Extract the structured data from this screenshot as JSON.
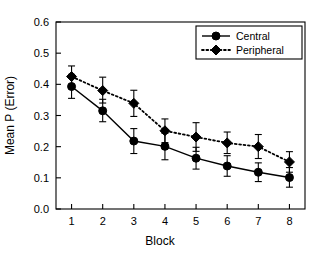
{
  "chart_data": {
    "type": "line",
    "title": "",
    "subtitle": "",
    "xlabel": "Block",
    "ylabel": "Mean P (Error)",
    "categories": [
      "1",
      "2",
      "3",
      "4",
      "5",
      "6",
      "7",
      "8"
    ],
    "x": [
      1,
      2,
      3,
      4,
      5,
      6,
      7,
      8
    ],
    "xlim": [
      0.5,
      8.5
    ],
    "ylim": [
      0.0,
      0.6
    ],
    "yticks": [
      "0.0",
      "0.1",
      "0.2",
      "0.3",
      "0.4",
      "0.5",
      "0.6"
    ],
    "ytick_values": [
      0.0,
      0.1,
      0.2,
      0.3,
      0.4,
      0.5,
      0.6
    ],
    "xticks": [
      "1",
      "2",
      "3",
      "4",
      "5",
      "6",
      "7",
      "8"
    ],
    "grid": false,
    "legend_position": "top-right",
    "series": [
      {
        "name": "Central",
        "marker": "circle",
        "linestyle": "solid",
        "color": "#000000",
        "values": [
          0.393,
          0.315,
          0.218,
          0.201,
          0.163,
          0.138,
          0.118,
          0.101
        ],
        "error_low": [
          0.355,
          0.28,
          0.178,
          0.158,
          0.128,
          0.105,
          0.088,
          0.07
        ],
        "error_high": [
          0.432,
          0.352,
          0.258,
          0.243,
          0.198,
          0.171,
          0.148,
          0.133
        ]
      },
      {
        "name": "Peripheral",
        "marker": "diamond",
        "linestyle": "dotted",
        "color": "#000000",
        "values": [
          0.425,
          0.38,
          0.339,
          0.251,
          0.231,
          0.212,
          0.2,
          0.151
        ],
        "error_low": [
          0.39,
          0.34,
          0.297,
          0.213,
          0.185,
          0.178,
          0.162,
          0.118
        ],
        "error_high": [
          0.459,
          0.423,
          0.381,
          0.289,
          0.277,
          0.247,
          0.239,
          0.184
        ]
      }
    ]
  },
  "legend": {
    "entries": [
      {
        "label": "Central"
      },
      {
        "label": "Peripheral"
      }
    ]
  },
  "axes": {
    "y_title": "Mean P (Error)",
    "x_title": "Block"
  }
}
